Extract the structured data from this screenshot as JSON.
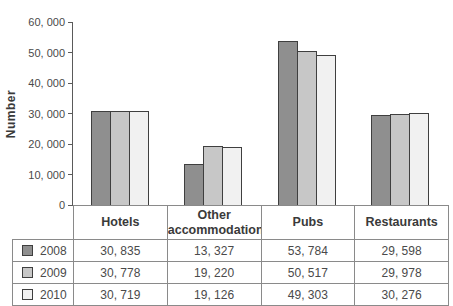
{
  "figure": {
    "ylabel": "Number"
  },
  "chart_data": {
    "type": "bar",
    "title": "",
    "xlabel": "",
    "ylabel": "Number",
    "categories": [
      "Hotels",
      "Other accommodation",
      "Pubs",
      "Restaurants"
    ],
    "series": [
      {
        "name": "2008",
        "values": [
          30835,
          13327,
          53784,
          29598
        ],
        "color": "#8f8f8f"
      },
      {
        "name": "2009",
        "values": [
          30778,
          19220,
          50517,
          29978
        ],
        "color": "#c7c7c7"
      },
      {
        "name": "2010",
        "values": [
          30719,
          19126,
          49303,
          30276
        ],
        "color": "#f1f1f1"
      }
    ],
    "ylim": [
      0,
      60000
    ],
    "ytick_step": 10000,
    "y_ticks": [
      {
        "value": 0,
        "label": "0"
      },
      {
        "value": 10000,
        "label": "10, 000"
      },
      {
        "value": 20000,
        "label": "20, 000"
      },
      {
        "value": 30000,
        "label": "30, 000"
      },
      {
        "value": 40000,
        "label": "40, 000"
      },
      {
        "value": 50000,
        "label": "50, 000"
      },
      {
        "value": 60000,
        "label": "60, 000"
      }
    ],
    "grid": false,
    "legend_position": "table-left",
    "bar_outline_color": "#3f3f3f"
  },
  "table": {
    "headers": [
      "Hotels",
      "Other accommodation",
      "Pubs",
      "Restaurants"
    ],
    "rows": [
      {
        "year": "2008",
        "cells": [
          "30, 835",
          "13, 327",
          "53, 784",
          "29, 598"
        ]
      },
      {
        "year": "2009",
        "cells": [
          "30, 778",
          "19, 220",
          "50, 517",
          "29, 978"
        ]
      },
      {
        "year": "2010",
        "cells": [
          "30, 719",
          "19, 126",
          "49, 303",
          "30, 276"
        ]
      }
    ],
    "border_color": "#8a8a8a"
  }
}
